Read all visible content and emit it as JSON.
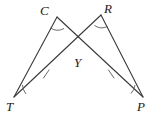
{
  "figure": {
    "type": "geometry-diagram",
    "width": 158,
    "height": 120,
    "background_color": "#ffffff",
    "stroke_color": "#3a3a3a",
    "label_color": "#1a1a1a"
  },
  "points": {
    "C": {
      "label": "C",
      "x": 57,
      "y": 17,
      "label_x": 40,
      "label_y": 4
    },
    "R": {
      "label": "R",
      "x": 101,
      "y": 15,
      "label_x": 104,
      "label_y": 2
    },
    "Y": {
      "label": "Y",
      "x": 79,
      "y": 52,
      "label_x": 74,
      "label_y": 56
    },
    "T": {
      "label": "T",
      "x": 14,
      "y": 97,
      "label_x": 6,
      "label_y": 100
    },
    "P": {
      "label": "P",
      "x": 143,
      "y": 97,
      "label_x": 137,
      "label_y": 100
    }
  },
  "segments": [
    {
      "name": "segment-TC",
      "from": "T",
      "to": "C"
    },
    {
      "name": "segment-CY",
      "from": "C",
      "to": "Y"
    },
    {
      "name": "segment-TP-through-Y",
      "from": "T",
      "to": "P"
    },
    {
      "name": "segment-YR",
      "from": "Y",
      "to": "R"
    },
    {
      "name": "segment-RP",
      "from": "R",
      "to": "P"
    },
    {
      "name": "segment-CP-through-Y",
      "from": "C",
      "to": "P"
    },
    {
      "name": "segment-RT-through-Y",
      "from": "R",
      "to": "T"
    }
  ],
  "tick_marks": [
    {
      "name": "tick-segment-TY",
      "on": "TY",
      "x": 46,
      "y": 74,
      "count": 1
    },
    {
      "name": "tick-segment-YP",
      "on": "YP",
      "x": 111,
      "y": 74,
      "count": 1
    }
  ],
  "angle_arcs": [
    {
      "name": "angle-arc-C",
      "at": "C",
      "count": 1
    },
    {
      "name": "angle-arc-R",
      "at": "R",
      "count": 1
    },
    {
      "name": "angle-arc-T",
      "at": "T",
      "count": 1
    },
    {
      "name": "angle-arc-P",
      "at": "P",
      "count": 1
    }
  ]
}
